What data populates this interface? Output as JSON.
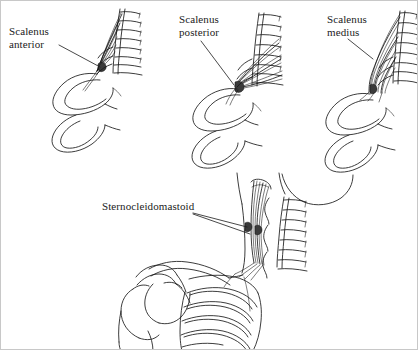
{
  "figure": {
    "background_color": "#ffffff",
    "ink_color": "#1a1a1a",
    "border_color": "#c8c8c8",
    "width": 418,
    "height": 350
  },
  "panels": [
    {
      "id": "panel-scalenus-anterior",
      "label_line1": "Scalenus",
      "label_line2": "anterior",
      "label_x": 8,
      "label_y": 24,
      "leader": "M58,44 L99,66",
      "description": "Cervical vertebrae with transverse processes and first two ribs; scalenus anterior muscle running from vertebrae to first rib"
    },
    {
      "id": "panel-scalenus-posterior",
      "label_line1": "Scalenus",
      "label_line2": "posterior",
      "label_x": 178,
      "label_y": 12,
      "leader": "M200,40 L233,84",
      "description": "Cervical vertebrae with transverse processes and first two ribs; scalenus posterior muscle fanning to second rib"
    },
    {
      "id": "panel-scalenus-medius",
      "label_line1": "Scalenus",
      "label_line2": "medius",
      "label_x": 326,
      "label_y": 12,
      "leader": "M347,38 L372,58",
      "description": "Cervical vertebrae with transverse processes and first two ribs; scalenus medius muscle broadly fanning to first rib"
    },
    {
      "id": "panel-sternocleidomastoid",
      "label_line1": "Sternocleidomastoid",
      "label_line2": "",
      "label_x": 101,
      "label_y": 199,
      "leader_a": "M192,212 L246,226",
      "leader_b": "M192,213 L249,233",
      "description": "Lateral view of neck, cervical spine, mastoid process, clavicle, scapula, humerus head and ribcage with sternocleidomastoid muscle"
    }
  ]
}
